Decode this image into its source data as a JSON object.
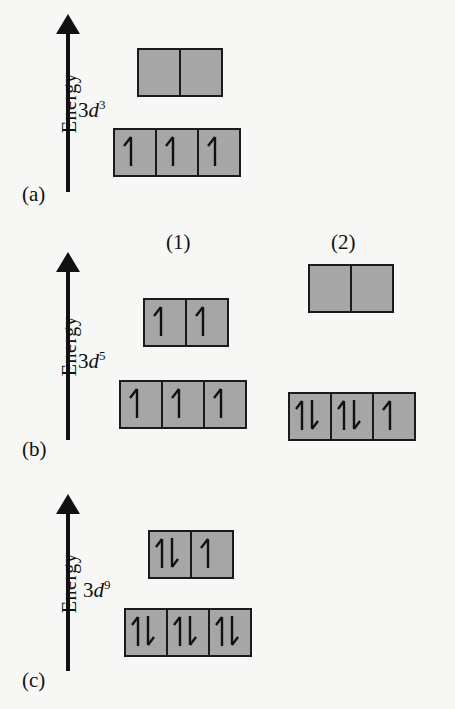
{
  "figure": {
    "axis_label": "Energy",
    "arrow_icon": "up-arrow-icon",
    "background_color": "#f7f7f5",
    "box_fill_color": "#a6a6a6",
    "box_border_color": "#1a1a1a",
    "ink_color": "#111111"
  },
  "columns": [
    {
      "id": "col1",
      "label": "(1)"
    },
    {
      "id": "col2",
      "label": "(2)"
    }
  ],
  "panels": [
    {
      "id": "a",
      "letter": "(a)",
      "orbital_prefix": "3",
      "orbital_symbol": "d",
      "orbital_superscript": "3",
      "orbital_label": "3d3",
      "configurations": [
        {
          "column": "col1",
          "upper_set": {
            "name": "eg",
            "cells": 2,
            "occupancy": [
              "empty",
              "empty"
            ]
          },
          "lower_set": {
            "name": "t2g",
            "cells": 3,
            "occupancy": [
              "up",
              "up",
              "up"
            ]
          },
          "unpaired_electrons": 3,
          "total_electrons": 3
        }
      ]
    },
    {
      "id": "b",
      "letter": "(b)",
      "orbital_prefix": "3",
      "orbital_symbol": "d",
      "orbital_superscript": "5",
      "orbital_label": "3d5",
      "configurations": [
        {
          "column": "col1",
          "upper_set": {
            "name": "eg",
            "cells": 2,
            "occupancy": [
              "up",
              "up"
            ]
          },
          "lower_set": {
            "name": "t2g",
            "cells": 3,
            "occupancy": [
              "up",
              "up",
              "up"
            ]
          },
          "unpaired_electrons": 5,
          "total_electrons": 5
        },
        {
          "column": "col2",
          "upper_set": {
            "name": "eg",
            "cells": 2,
            "occupancy": [
              "empty",
              "empty"
            ]
          },
          "lower_set": {
            "name": "t2g",
            "cells": 3,
            "occupancy": [
              "pair",
              "pair",
              "up"
            ]
          },
          "unpaired_electrons": 1,
          "total_electrons": 5
        }
      ]
    },
    {
      "id": "c",
      "letter": "(c)",
      "orbital_prefix": "3",
      "orbital_symbol": "d",
      "orbital_superscript": "9",
      "orbital_label": "3d9",
      "configurations": [
        {
          "column": "col1",
          "upper_set": {
            "name": "eg",
            "cells": 2,
            "occupancy": [
              "pair",
              "up"
            ]
          },
          "lower_set": {
            "name": "t2g",
            "cells": 3,
            "occupancy": [
              "pair",
              "pair",
              "pair"
            ]
          },
          "unpaired_electrons": 1,
          "total_electrons": 9
        }
      ]
    }
  ]
}
